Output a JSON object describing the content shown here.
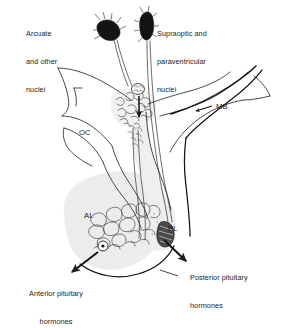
{
  "figure": {
    "type": "anatomical-line-diagram",
    "background_color": "#ffffff",
    "ink_color": "#1c1c1c",
    "gland_fill_color": "#ececec",
    "width": 287,
    "height": 301
  },
  "labels": {
    "arcuate": {
      "text": "Arcuate\nand other\nnuclei",
      "lines": [
        "Arcuate",
        "and other",
        "nuclei"
      ],
      "x": 26,
      "y": 11,
      "align": "left"
    },
    "supraoptic": {
      "text": "Supraoptic and\nparaventricular\nnuclei",
      "lines": [
        "Supraoptic and",
        "paraventricular",
        "nuclei"
      ],
      "x": 157,
      "y": 11,
      "align": "left"
    },
    "mammillary_body": {
      "text": "MB",
      "x": 216,
      "y": 103,
      "align": "left"
    },
    "optic_chiasm": {
      "text": "OC",
      "x": 79,
      "y": 129,
      "align": "left"
    },
    "anterior_lobe": {
      "text": "AL",
      "x": 84,
      "y": 212,
      "align": "left"
    },
    "posterior_lobe": {
      "text": "PL",
      "x": 168,
      "y": 225,
      "align": "left"
    },
    "anterior_hormones": {
      "text": "Anterior pituitary\nhormones",
      "lines": [
        "Anterior pituitary",
        "hormones"
      ],
      "x": 8,
      "y": 271,
      "align": "center"
    },
    "posterior_hormones": {
      "text": "Posterior pituitary\nhormones",
      "lines": [
        "Posterior pituitary",
        "hormones"
      ],
      "x": 190,
      "y": 255,
      "align": "left"
    }
  },
  "structures": {
    "arcuate_nucleus_cluster": "dark-triangular-neuron-cluster",
    "supraoptic_nucleus_cluster": "dark-leaf-neuron-cluster",
    "median_eminence": "capillary-plexus",
    "portal_vessels": "long-portal-veins",
    "infundibular_stalk": "pituitary-stalk",
    "anterior_lobe_sinusoids": "sinusoid-network",
    "posterior_lobe_terminals": "axon-terminal-cluster"
  }
}
